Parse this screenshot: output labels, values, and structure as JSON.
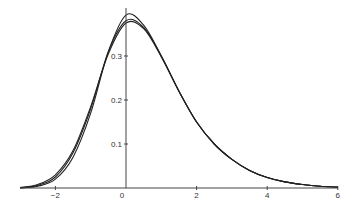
{
  "chart_data": {
    "type": "line",
    "title": "",
    "xlabel": "",
    "ylabel": "",
    "xlim": [
      -3,
      6
    ],
    "ylim": [
      0,
      0.4
    ],
    "grid": false,
    "legend": null,
    "x_ticks": [
      {
        "value": -2,
        "label": "−2"
      },
      {
        "value": 0,
        "label": "0"
      },
      {
        "value": 2,
        "label": "2"
      },
      {
        "value": 4,
        "label": "4"
      },
      {
        "value": 6,
        "label": "6"
      }
    ],
    "y_ticks": [
      {
        "value": 0.1,
        "label": "0.1"
      },
      {
        "value": 0.2,
        "label": "0.2"
      },
      {
        "value": 0.3,
        "label": "0.3"
      }
    ],
    "x": [
      -3,
      -2.5,
      -2,
      -1.5,
      -1,
      -0.5,
      0,
      0.5,
      1,
      1.5,
      2,
      2.5,
      3,
      3.5,
      4,
      4.5,
      5,
      5.5,
      6
    ],
    "series": [
      {
        "name": "curve-1",
        "values": [
          0.0,
          0.004,
          0.02,
          0.07,
          0.17,
          0.31,
          0.393,
          0.37,
          0.3,
          0.22,
          0.15,
          0.1,
          0.065,
          0.04,
          0.024,
          0.014,
          0.008,
          0.004,
          0.002
        ]
      },
      {
        "name": "curve-2",
        "values": [
          0.0,
          0.006,
          0.025,
          0.08,
          0.18,
          0.31,
          0.38,
          0.365,
          0.3,
          0.22,
          0.15,
          0.1,
          0.065,
          0.04,
          0.024,
          0.014,
          0.008,
          0.004,
          0.002
        ]
      },
      {
        "name": "curve-3",
        "values": [
          0.001,
          0.008,
          0.03,
          0.085,
          0.185,
          0.305,
          0.375,
          0.362,
          0.298,
          0.22,
          0.15,
          0.1,
          0.065,
          0.04,
          0.024,
          0.014,
          0.008,
          0.004,
          0.002
        ]
      }
    ]
  }
}
